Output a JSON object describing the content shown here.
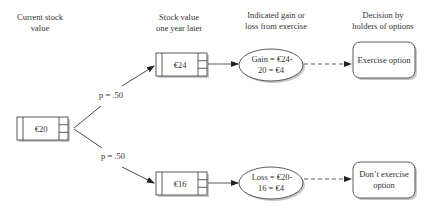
{
  "headers": {
    "current": [
      "Current stock",
      "value"
    ],
    "later": [
      "Stock value",
      "one year later"
    ],
    "gain_loss": [
      "Indicated gain or",
      "loss from exercise"
    ],
    "decision": [
      "Decision by",
      "holders of options"
    ]
  },
  "nodes": {
    "start": {
      "label": "€20"
    },
    "up": {
      "label": "€24"
    },
    "down": {
      "label": "€16"
    },
    "gain": {
      "lines": [
        "Gain = €24-",
        "20 = €4"
      ]
    },
    "loss": {
      "lines": [
        "Loss = €20-",
        "16 = €4"
      ]
    },
    "exercise": {
      "lines": [
        "Exercise option"
      ]
    },
    "no_exercise": {
      "lines": [
        "Don’t exercise",
        "option"
      ]
    }
  },
  "edges": {
    "p_up": "p = .50",
    "p_down": "p = .50"
  },
  "colors": {
    "line": "#333333",
    "shadow": "#bdbdbd",
    "fill": "#ffffff"
  }
}
